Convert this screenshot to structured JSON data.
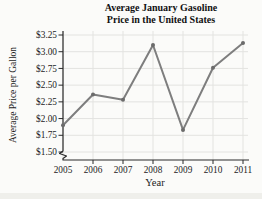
{
  "figure": {
    "title_line1": "Average January Gasoline",
    "title_line2": "Price in the United States"
  },
  "chart_data": {
    "type": "line",
    "title": "Average January Gasoline Price in the United States",
    "xlabel": "Year",
    "ylabel": "Average Price per Gallon",
    "x": [
      "2005",
      "2006",
      "2007",
      "2008",
      "2009",
      "2010",
      "2011"
    ],
    "series": [
      {
        "name": "Average January gasoline price ($ per gallon)",
        "values": [
          1.9,
          2.36,
          2.28,
          3.1,
          1.83,
          2.76,
          3.13
        ]
      }
    ],
    "y_tick_labels": [
      "$3.25",
      "$3.00",
      "$2.75",
      "$2.50",
      "$2.25",
      "$2.00",
      "$1.75",
      "$1.50"
    ],
    "y_tick_values": [
      3.25,
      3.0,
      2.75,
      2.5,
      2.25,
      2.0,
      1.75,
      1.5
    ],
    "ylim": [
      1.5,
      3.25
    ],
    "grid": true,
    "axis_break_at_origin": true,
    "legend_position": "none",
    "colors": {
      "line": "#7e7e7e",
      "marker": "#6b6b6b",
      "grid": "#e3e3e0",
      "axis": "#2b2b2b",
      "text": "#1c1c1c"
    }
  }
}
